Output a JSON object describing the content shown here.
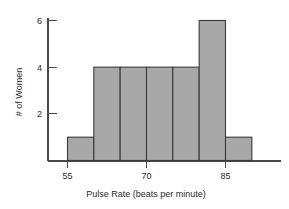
{
  "chart_data": {
    "type": "bar",
    "title": "",
    "subtitle": "",
    "xlabel": "Pulse Rate (beats per minute)",
    "ylabel": "# of Women",
    "grid": false,
    "legend": false,
    "legend_position": "none",
    "histogram": true,
    "bin_width": 5,
    "bin_edges": [
      55,
      60,
      65,
      70,
      75,
      80,
      85,
      90
    ],
    "categories": [
      "55-60",
      "60-65",
      "65-70",
      "70-75",
      "75-80",
      "80-85",
      "85-90"
    ],
    "values": [
      1,
      4,
      4,
      4,
      4,
      6,
      1
    ],
    "x": [
      57.5,
      62.5,
      67.5,
      72.5,
      77.5,
      82.5,
      87.5
    ],
    "xlim": [
      55,
      90
    ],
    "ylim": [
      0,
      6
    ],
    "xticks": [
      55,
      70,
      85
    ],
    "xtick_labels": [
      "55",
      "70",
      "85"
    ],
    "yticks": [
      2,
      4,
      6
    ],
    "ytick_labels": [
      "2",
      "4",
      "6"
    ],
    "bar_fill": "#a8a8a8",
    "bar_edge": "#3a3a3a",
    "axis_color": "#4a4a4a",
    "background": "#ffffff"
  },
  "axes": {
    "x_title": "Pulse Rate (beats per minute)",
    "y_title": "# of Women",
    "x_tick_0": "55",
    "x_tick_1": "70",
    "x_tick_2": "85",
    "y_tick_0": "2",
    "y_tick_1": "4",
    "y_tick_2": "6"
  }
}
